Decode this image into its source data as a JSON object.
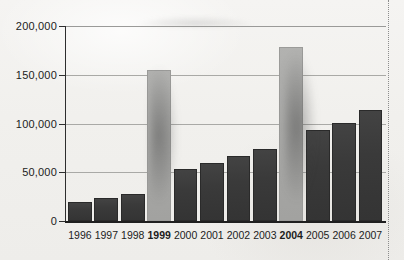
{
  "chart_data": {
    "type": "bar",
    "title": "",
    "subtitle": "",
    "xlabel": "",
    "ylabel": "",
    "categories": [
      "1996",
      "1997",
      "1998",
      "1999",
      "2000",
      "2001",
      "2002",
      "2003",
      "2004",
      "2005",
      "2006",
      "2007"
    ],
    "values": [
      20000,
      24000,
      28000,
      155000,
      53000,
      60000,
      67000,
      74000,
      178000,
      93000,
      101000,
      114000
    ],
    "highlighted_categories": [
      "1999",
      "2004"
    ],
    "ylim": [
      0,
      200000
    ],
    "ytick_labels": [
      "200,000",
      "150,000",
      "100,000",
      "50,000",
      "0"
    ],
    "ytick_values": [
      200000,
      150000,
      100000,
      50000,
      0
    ],
    "grid": true,
    "legend": "none",
    "series": [
      {
        "name": "",
        "values": [
          20000,
          24000,
          28000,
          155000,
          53000,
          60000,
          67000,
          74000,
          178000,
          93000,
          101000,
          114000
        ]
      }
    ],
    "bar_colors": {
      "default": "#3a3a3a",
      "highlight": "#a8a8a6"
    },
    "axis_color": "#1f1f1f",
    "grid_color": "#9a9a98",
    "background": "#f2f1ef"
  }
}
